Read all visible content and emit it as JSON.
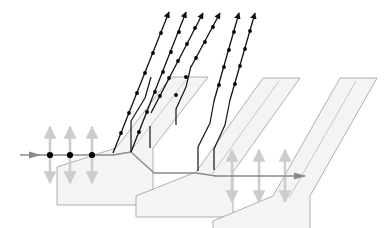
{
  "figure": {
    "background_color": "#ffffff",
    "width": 387,
    "height": 228
  },
  "colors": {
    "ray_black": "#111111",
    "ray_gray": "#8a8a8a",
    "slab_fill": "#f4f4f4",
    "slab_stroke": "#9c9c9c",
    "polarization_arrow": "#cccccc",
    "dot_black": "#000000"
  },
  "slabs": {
    "count": 3,
    "fill": "#f4f4f4",
    "stroke": "#9c9c9c",
    "stroke_width": 0.8,
    "tilt_label": "Brewster angle plates",
    "items": [
      {
        "name": "slab-1",
        "points": "116,148 171,79 208,79 154,148 154,205 56,205 56,165"
      },
      {
        "name": "slab-2",
        "points": "195,172 262,79 299,79 232,172 232,216 134,216 134,195"
      },
      {
        "name": "slab-3",
        "points": "272,196 339,79 376,79 309,196 309,228 211,228 211,219"
      }
    ],
    "parallelograms": [
      {
        "name": "slab-1-body",
        "points": "116,148 168,76 202,76 150,148 150,204 57,204"
      }
    ]
  },
  "input_beam": {
    "name": "incident-unpolarized-beam",
    "label": "incident unpolarized light",
    "start_x": 20,
    "end_x": 113,
    "y": 155,
    "color": "#8a8a8a",
    "dots": [
      {
        "x": 50,
        "y": 155
      },
      {
        "x": 70,
        "y": 155
      },
      {
        "x": 92,
        "y": 155
      }
    ],
    "polarization_arrows": [
      {
        "x": 50,
        "y": 155,
        "half_length": 28
      },
      {
        "x": 70,
        "y": 155,
        "half_length": 28
      },
      {
        "x": 92,
        "y": 155,
        "half_length": 28
      }
    ]
  },
  "output_beam": {
    "name": "transmitted-polarized-beam",
    "label": "transmitted p-polarized light",
    "start_x": 215,
    "end_x": 305,
    "y": 176,
    "color": "#8a8a8a",
    "dots": [],
    "polarization_arrows": [
      {
        "x": 232,
        "y": 176,
        "half_length": 26
      },
      {
        "x": 259,
        "y": 176,
        "half_length": 26
      },
      {
        "x": 285,
        "y": 176,
        "half_length": 26
      }
    ]
  },
  "reflected_rays": {
    "name": "reflected-s-polarized-rays",
    "label": "reflected s-polarized rays",
    "count": 6,
    "color": "#111111",
    "stroke_width": 1.3,
    "dot_radius": 1.9,
    "arrow_size": 5,
    "items": [
      {
        "name": "reflected-ray-1",
        "x1": 113,
        "y1": 153,
        "x2": 169,
        "y2": 12,
        "dot_count": 7
      },
      {
        "name": "reflected-ray-2",
        "x1": 130,
        "y1": 152,
        "x2": 186,
        "y2": 12,
        "dot_count": 7
      },
      {
        "name": "reflected-ray-3",
        "x1": 158,
        "y1": 126,
        "x2": 203,
        "y2": 14,
        "dot_count": 6
      },
      {
        "name": "reflected-ray-4",
        "x1": 175,
        "y1": 125,
        "x2": 220,
        "y2": 14,
        "dot_count": 6
      },
      {
        "name": "reflected-ray-5",
        "x1": 212,
        "y1": 102,
        "x2": 239,
        "y2": 13,
        "dot_count": 5
      },
      {
        "name": "reflected-ray-6",
        "x1": 228,
        "y1": 100,
        "x2": 255,
        "y2": 13,
        "dot_count": 5
      }
    ]
  },
  "internal_rays": {
    "name": "internal-refracted-segments",
    "label": "refracted segments inside plates",
    "color": "#1a1a1a",
    "stroke_width": 1.2,
    "paths": [
      {
        "name": "internal-path-1",
        "d": "M131,152 L131,122 L145,99 L152,76"
      },
      {
        "name": "internal-path-2",
        "d": "M158,126 L158,113"
      },
      {
        "name": "internal-path-3",
        "d": "M176,125 L176,110 L186,88 L192,67"
      },
      {
        "name": "internal-path-4",
        "d": "M198,171 L198,148 L210,124 L214,102"
      },
      {
        "name": "internal-path-5",
        "d": "M213,170 L213,150 L224,126 L229,101"
      },
      {
        "name": "internal-path-6",
        "d": "M150,148 L150,124"
      }
    ]
  },
  "transmitted_path": {
    "name": "transmitted-gray-path",
    "label": "beam refracted through the plate stack",
    "color": "#8a8a8a",
    "stroke_width": 1.4,
    "d": "M113,155 L131,152 L154,173 L196,173 L216,176"
  },
  "legend": {
    "dot_meaning": "polarization component perpendicular to page",
    "arrow_meaning": "polarization component in plane of page"
  }
}
